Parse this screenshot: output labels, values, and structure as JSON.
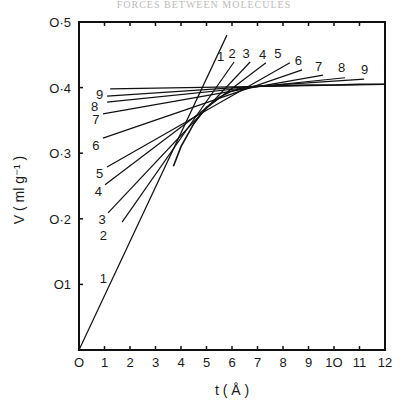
{
  "header": {
    "text": "FORCES BETWEEN MOLECULES"
  },
  "chart_data": {
    "type": "line",
    "title": "",
    "xlabel": "t ( Å )",
    "ylabel": "V ( ml g⁻¹ )",
    "xlim": [
      0,
      12
    ],
    "ylim": [
      0,
      0.5
    ],
    "x_ticks": [
      0,
      1,
      2,
      3,
      4,
      5,
      6,
      7,
      8,
      9,
      10,
      11,
      12
    ],
    "x_tick_labels": [
      "O",
      "1",
      "2",
      "3",
      "4",
      "5",
      "6",
      "7",
      "8",
      "9",
      "1O",
      "11",
      "12"
    ],
    "y_ticks": [
      0.1,
      0.2,
      0.3,
      0.4,
      0.5
    ],
    "y_tick_labels": [
      "O1",
      "O·2",
      "O·3",
      "O·4",
      "O·5"
    ],
    "grid": false,
    "legend": "none",
    "series": [
      {
        "name": "isotherm-envelope",
        "x": [
          3.7,
          4.0,
          4.5,
          5.0,
          5.5,
          6.0,
          6.5,
          7.0,
          8.0,
          9.0,
          10.0,
          11.0,
          12.0
        ],
        "y": [
          0.28,
          0.31,
          0.345,
          0.37,
          0.385,
          0.395,
          0.4,
          0.402,
          0.403,
          0.404,
          0.404,
          0.405,
          0.405
        ]
      }
    ],
    "tangent_lines": [
      {
        "label": "1",
        "x": [
          0.0,
          5.8
        ],
        "y": [
          0.0,
          0.48
        ],
        "label_left": {
          "x": 1.1,
          "y": 0.11
        },
        "label_right": {
          "x": 5.55,
          "y": 0.44
        }
      },
      {
        "label": "2",
        "x": [
          1.69,
          6.08
        ],
        "y": [
          0.195,
          0.439
        ],
        "label_left": {
          "x": 1.1,
          "y": 0.175
        },
        "label_right": {
          "x": 6.0,
          "y": 0.445
        }
      },
      {
        "label": "3",
        "x": [
          1.14,
          6.71
        ],
        "y": [
          0.209,
          0.439
        ],
        "label_left": {
          "x": 1.05,
          "y": 0.2
        },
        "label_right": {
          "x": 6.55,
          "y": 0.445
        }
      },
      {
        "label": "4",
        "x": [
          1.02,
          7.33
        ],
        "y": [
          0.252,
          0.438
        ],
        "label_left": {
          "x": 0.9,
          "y": 0.243
        },
        "label_right": {
          "x": 7.2,
          "y": 0.443
        }
      },
      {
        "label": "5",
        "x": [
          1.1,
          8.27
        ],
        "y": [
          0.279,
          0.438
        ],
        "label_left": {
          "x": 0.95,
          "y": 0.27
        },
        "label_right": {
          "x": 7.8,
          "y": 0.445
        }
      },
      {
        "label": "6",
        "x": [
          0.94,
          8.75
        ],
        "y": [
          0.323,
          0.427
        ],
        "label_left": {
          "x": 0.8,
          "y": 0.313
        },
        "label_right": {
          "x": 8.6,
          "y": 0.435
        }
      },
      {
        "label": "7",
        "x": [
          0.94,
          9.57
        ],
        "y": [
          0.36,
          0.419
        ],
        "label_left": {
          "x": 0.8,
          "y": 0.352
        },
        "label_right": {
          "x": 9.4,
          "y": 0.425
        }
      },
      {
        "label": "8",
        "x": [
          1.1,
          10.43
        ],
        "y": [
          0.378,
          0.415
        ],
        "label_left": {
          "x": 0.75,
          "y": 0.372
        },
        "label_right": {
          "x": 10.3,
          "y": 0.424
        }
      },
      {
        "label": "",
        "x": [
          1.1,
          11.18
        ],
        "y": [
          0.387,
          0.413
        ]
      },
      {
        "label": "9",
        "x": [
          1.22,
          12.0
        ],
        "y": [
          0.398,
          0.405
        ],
        "label_left": {
          "x": 0.95,
          "y": 0.39
        },
        "label_right": {
          "x": 11.2,
          "y": 0.42
        }
      }
    ]
  }
}
